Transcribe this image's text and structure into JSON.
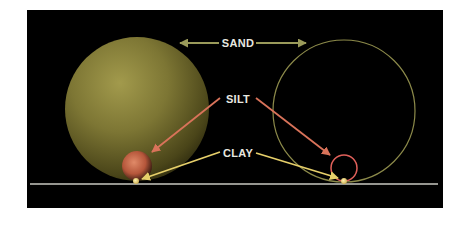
{
  "diagram": {
    "title": "",
    "labels": {
      "sand": "SAND",
      "silt": "SILT",
      "clay": "CLAY"
    },
    "colors": {
      "background": "#000000",
      "page": "#ffffff",
      "sand_arrow": "#9a9a5a",
      "silt_arrow": "#d9735a",
      "clay_arrow": "#e6cf6a",
      "ground_line": "#c8c8c0",
      "sand_sphere_light": "#9c9448",
      "sand_sphere_dark": "#3a3614",
      "sand_outline": "#8c8a4a",
      "silt_sphere": "#d77a5a",
      "silt_outline": "#e0605a",
      "clay_dot": "#e8d890",
      "label_text": "#e8e8e0"
    },
    "nodes": [
      {
        "id": "sand-sphere-left",
        "shape": "filled-sphere",
        "cx": 137,
        "cy": 109,
        "r": 72
      },
      {
        "id": "sand-circle-right",
        "shape": "outline-circle",
        "cx": 344,
        "cy": 111,
        "r": 71
      },
      {
        "id": "silt-sphere-left",
        "shape": "filled-sphere",
        "cx": 137,
        "cy": 166,
        "r": 15
      },
      {
        "id": "silt-circle-right",
        "shape": "outline-circle",
        "cx": 344,
        "cy": 168,
        "r": 13
      },
      {
        "id": "clay-dot-left",
        "shape": "dot",
        "cx": 136,
        "cy": 181,
        "r": 3
      },
      {
        "id": "clay-dot-right",
        "shape": "dot",
        "cx": 344,
        "cy": 181,
        "r": 3
      }
    ],
    "edges": [
      {
        "from": "SAND",
        "to": "sand-sphere-left",
        "color": "sand_arrow"
      },
      {
        "from": "SAND",
        "to": "sand-circle-right",
        "color": "sand_arrow"
      },
      {
        "from": "SILT",
        "to": "silt-sphere-left",
        "color": "silt_arrow"
      },
      {
        "from": "SILT",
        "to": "silt-circle-right",
        "color": "silt_arrow"
      },
      {
        "from": "CLAY",
        "to": "clay-dot-left",
        "color": "clay_arrow"
      },
      {
        "from": "CLAY",
        "to": "clay-dot-right",
        "color": "clay_arrow"
      }
    ],
    "ground_line": {
      "y": 184,
      "x1": 30,
      "x2": 438
    }
  }
}
